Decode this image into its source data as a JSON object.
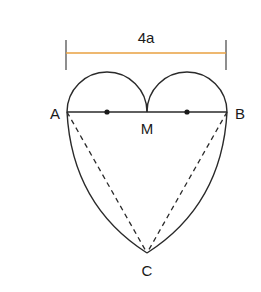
{
  "diagram": {
    "dimension_label": "4a",
    "points": {
      "A": "A",
      "B": "B",
      "M": "M",
      "C": "C"
    },
    "colors": {
      "dimension_line": "#e8a040",
      "stroke": "#2a2a2a"
    }
  }
}
